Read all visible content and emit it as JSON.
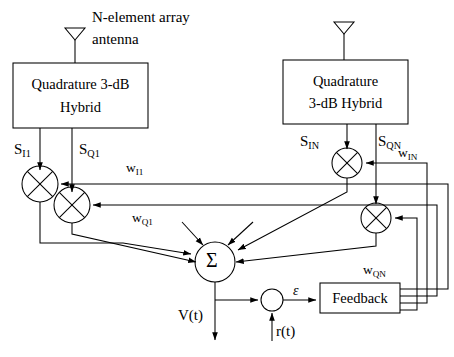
{
  "diagram": {
    "annotation_top": "N-element array",
    "annotation_top2": "antenna"
  },
  "blocks": {
    "hybrid_left_line1": "Quadrature 3-dB",
    "hybrid_left_line2": "Hybrid",
    "hybrid_right_line1": "Quadrature",
    "hybrid_right_line2": "3-dB Hybrid",
    "feedback": "Feedback"
  },
  "nodes": {
    "summer": "Σ",
    "mixer_symbol": "⊗",
    "error_node": ""
  },
  "signals": {
    "s_i1_base": "S",
    "s_i1_sub": "I1",
    "s_q1_base": "S",
    "s_q1_sub": "Q1",
    "s_in_base": "S",
    "s_in_sub": "IN",
    "s_qn_base": "S",
    "s_qn_sub": "QN",
    "w_i1_base": "w",
    "w_i1_sub": "I1",
    "w_q1_base": "w",
    "w_q1_sub": "Q1",
    "w_in_base": "w",
    "w_in_sub": "IN",
    "w_qn_base": "w",
    "w_qn_sub": "QN",
    "v_t": "V(t)",
    "r_t": "r(t)",
    "epsilon": "ε"
  },
  "colors": {
    "stroke": "#000000",
    "background": "#ffffff",
    "text": "#000000"
  }
}
